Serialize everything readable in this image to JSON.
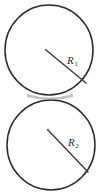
{
  "figure": {
    "background_color": "#ffffff",
    "stroke_color": "#2b2b2b",
    "radius_line_color": "#3a3a3a",
    "center_dot_color": "#6d6d6d",
    "shapes": [
      {
        "name": "upper-circle",
        "cx": 49,
        "cy": 50,
        "rx": 44,
        "ry": 45,
        "center_dot": {
          "x": 46,
          "y": 50
        },
        "radius_line": {
          "x1": 46,
          "y1": 50,
          "x2": 86,
          "y2": 83
        },
        "label": {
          "symbol": "R",
          "subscript": "1",
          "x": 67,
          "y": 55
        }
      },
      {
        "name": "lower-circle",
        "cx": 51,
        "cy": 145,
        "rx": 44,
        "ry": 45,
        "center_dot": {
          "x": 48,
          "y": 130
        },
        "radius_line": {
          "x1": 48,
          "y1": 130,
          "x2": 88,
          "y2": 172
        },
        "label": {
          "symbol": "R",
          "subscript": "2",
          "x": 68,
          "y": 137
        }
      }
    ],
    "tangent_point": {
      "x": 50,
      "y": 99
    }
  }
}
